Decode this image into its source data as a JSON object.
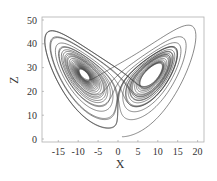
{
  "chart_data": {
    "type": "line",
    "title": "",
    "xlabel": "X",
    "ylabel": "Z",
    "xlim": [
      -19,
      21.5
    ],
    "ylim": [
      -1,
      51
    ],
    "xticks": [
      -15,
      -10,
      -5,
      0,
      5,
      10,
      15,
      20
    ],
    "xtick_labels": [
      "-15",
      "-10",
      "-5",
      "0",
      "5",
      "10",
      "15",
      "20"
    ],
    "yticks": [
      0,
      10,
      20,
      30,
      40,
      50
    ],
    "ytick_labels": [
      "0",
      "10",
      "20",
      "30",
      "40",
      "50"
    ],
    "grid": false,
    "legend": null,
    "series": [
      {
        "name": "Lorenz attractor trajectory (X-Z projection)",
        "description": "Butterfly-shaped trajectory with two lobes: left lobe centered near (-8.5, 27), right lobe centered near (8.5, 27); starts near (1, 1) and rises into the right lobe",
        "generator": {
          "system": "lorenz",
          "sigma": 10,
          "rho": 28,
          "beta": 2.6667,
          "initial": [
            1,
            1,
            1
          ],
          "dt": 0.005,
          "steps": 7000
        },
        "color": "#3a3a3a"
      }
    ],
    "annotations": []
  },
  "axes_labels": {
    "x": "X",
    "y": "Z"
  }
}
